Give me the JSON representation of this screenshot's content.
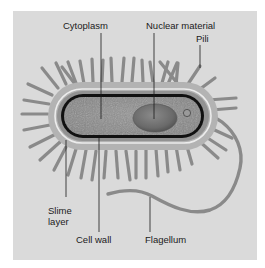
{
  "figure": {
    "background_color": "#dadada",
    "labels": {
      "cytoplasm": "Cytoplasm",
      "nuclear_material": "Nuclear material",
      "pili": "Pili",
      "slime_layer": "Slime layer",
      "cell_wall": "Cell wall",
      "flagellum": "Flagellum"
    },
    "colors": {
      "slime_layer": "#b3b3b3",
      "white_line": "#ececec",
      "cell_wall": "#929292",
      "membrane": "#111111",
      "cytoplasm": "#8c8c8c",
      "nucleoid": "#6e6e6e",
      "pili": "#8a8a8a",
      "flagellum": "#8a8a8a",
      "leader_line": "#1a1a1a"
    }
  }
}
